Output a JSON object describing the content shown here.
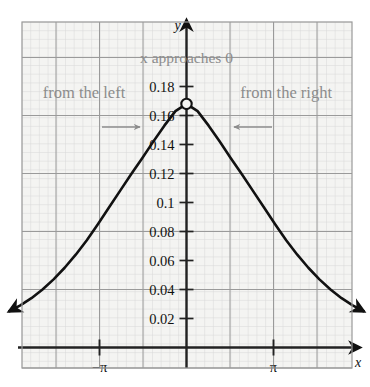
{
  "chart_data": {
    "type": "line",
    "title": "",
    "xlabel": "x",
    "ylabel": "y",
    "grid": true,
    "legend": null,
    "xlim": [
      -6.73,
      6.28
    ],
    "ylim": [
      0,
      0.207
    ],
    "xticks": [
      -3.14159,
      3.14159
    ],
    "xticklabels": [
      "−π",
      "π"
    ],
    "yticks": [
      0.02,
      0.04,
      0.06,
      0.08,
      0.1,
      0.12,
      0.14,
      0.16,
      0.18
    ],
    "yticklabels": [
      "0.02",
      "0.04",
      "0.06",
      "0.08",
      "0.1",
      "0.12",
      "0.14",
      "0.16",
      "0.18"
    ],
    "series": [
      {
        "name": "curve",
        "style": "solid-black-arrows-both-ends",
        "x": [
          -6.4,
          -6.0,
          -5.6,
          -5.2,
          -4.8,
          -4.4,
          -4.0,
          -3.6,
          -3.2,
          -2.8,
          -2.4,
          -2.0,
          -1.6,
          -1.2,
          -0.8,
          -0.4,
          0.0,
          0.4,
          0.8,
          1.2,
          1.6,
          2.0,
          2.4,
          2.8,
          3.2,
          3.6,
          4.0,
          4.4,
          4.8,
          5.2,
          5.6,
          6.0,
          6.4
        ],
        "y": [
          0.025,
          0.029,
          0.034,
          0.04,
          0.047,
          0.055,
          0.064,
          0.074,
          0.085,
          0.0965,
          0.108,
          0.1195,
          0.1305,
          0.142,
          0.153,
          0.163,
          0.168,
          0.163,
          0.153,
          0.142,
          0.1305,
          0.1195,
          0.108,
          0.0965,
          0.085,
          0.074,
          0.064,
          0.055,
          0.047,
          0.04,
          0.034,
          0.029,
          0.025
        ]
      }
    ],
    "markers": [
      {
        "name": "open-hole",
        "x": 0.0,
        "y": 0.168,
        "style": "open-circle"
      }
    ],
    "annotations": [
      {
        "name": "x-approaches-zero",
        "text": "x approaches 0",
        "x": 0.0,
        "y": 0.196
      },
      {
        "name": "from-the-left",
        "text": "from the left",
        "x": -3.7,
        "y": 0.172
      },
      {
        "name": "from-the-right",
        "text": "from the right",
        "x": 3.6,
        "y": 0.172
      },
      {
        "name": "arrow-left-to-right",
        "direction": "right"
      },
      {
        "name": "arrow-right-to-left",
        "direction": "left"
      }
    ],
    "colors": {
      "curve": "#111111",
      "axis": "#222222",
      "major_grid": "#9a9a9a",
      "minor_grid": "#d8d8d8",
      "annotation_text": "#8c8c8c",
      "tick_text": "#111111",
      "background": "#f4f4f2"
    }
  },
  "axis_labels": {
    "x": "x",
    "y": "y"
  }
}
